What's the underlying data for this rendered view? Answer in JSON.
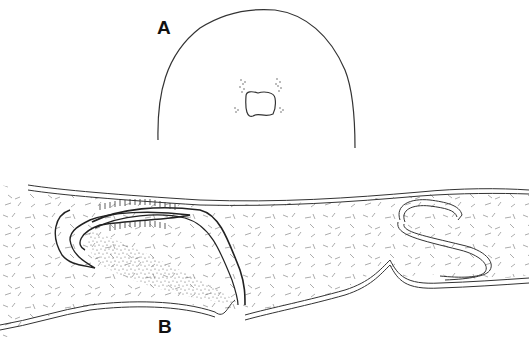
{
  "figure": {
    "panels": [
      {
        "id": "A",
        "label": "A",
        "description": "Transverse outline section with central cavity and flanking stippled clusters"
      },
      {
        "id": "B",
        "label": "B",
        "description": "Longitudinal section showing folded epithelial layers, stippled tissue and scattered fibres"
      }
    ],
    "colors": {
      "ink": "#222222",
      "stipple": "#555555",
      "fibre": "#777777",
      "background": "#ffffff"
    }
  }
}
